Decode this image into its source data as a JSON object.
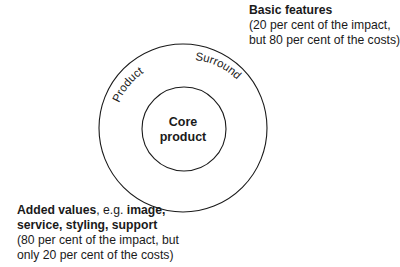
{
  "diagram": {
    "type": "concentric-circles",
    "outer_ring": {
      "labels": [
        "Product",
        "Surround"
      ],
      "center": [
        183,
        128
      ],
      "radius": 84
    },
    "inner_circle": {
      "label_line1": "Core",
      "label_line2": "product",
      "center": [
        184,
        129
      ],
      "radius": 42
    },
    "stroke_color": "#1a1a1a"
  },
  "annotations": {
    "basic": {
      "title": "Basic features",
      "line1": "(20 per cent of the impact,",
      "line2": "but 80 per cent of the costs)"
    },
    "added": {
      "title": "Added values",
      "sep": ", e.g. ",
      "examples_a": "image,",
      "examples_b": "service, styling, support",
      "line1": "(80 per cent of the impact, but",
      "line2": "only 20 per cent of the costs)"
    }
  }
}
